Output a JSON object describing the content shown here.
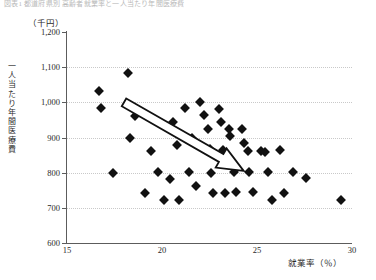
{
  "figure": {
    "caption": "図表1 都道府県別 高齢者就業率と一人当たり年間医療費",
    "y_unit": "（千円）",
    "y_axis_label": "一人当たり年間医療費",
    "x_axis_label": "就業率（％）"
  },
  "chart_data": {
    "type": "scatter",
    "title": "",
    "xlabel": "就業率（％）",
    "ylabel": "一人当たり年間医療費",
    "y_unit": "千円",
    "xlim": [
      15,
      30
    ],
    "ylim": [
      600,
      1200
    ],
    "xticks": [
      "15",
      "20",
      "25",
      "30"
    ],
    "yticks": [
      "600",
      "700",
      "800",
      "900",
      "1,000",
      "1,100",
      "1,200"
    ],
    "grid": "horizontal-dotted",
    "legend": "none",
    "marker": "diamond",
    "marker_color": "#111111",
    "annotation": {
      "kind": "block-arrow",
      "meaning": "negative-correlation-trend",
      "fill": "#ffffff",
      "stroke": "#111111",
      "from": [
        18.0,
        1000
      ],
      "to": [
        24.3,
        805
      ]
    },
    "points": [
      [
        16.7,
        1031
      ],
      [
        16.8,
        984
      ],
      [
        17.4,
        800
      ],
      [
        18.2,
        1084
      ],
      [
        18.3,
        899
      ],
      [
        18.6,
        961
      ],
      [
        19.1,
        741
      ],
      [
        19.4,
        863
      ],
      [
        19.8,
        803
      ],
      [
        20.1,
        722
      ],
      [
        20.4,
        781
      ],
      [
        20.6,
        945
      ],
      [
        20.8,
        879
      ],
      [
        20.9,
        723
      ],
      [
        21.2,
        984
      ],
      [
        21.4,
        802
      ],
      [
        21.6,
        899
      ],
      [
        21.8,
        762
      ],
      [
        22.0,
        1002
      ],
      [
        22.2,
        963
      ],
      [
        22.4,
        924
      ],
      [
        22.5,
        866
      ],
      [
        22.6,
        799
      ],
      [
        22.7,
        741
      ],
      [
        23.0,
        982
      ],
      [
        23.1,
        944
      ],
      [
        23.2,
        865
      ],
      [
        23.3,
        742
      ],
      [
        23.5,
        923
      ],
      [
        23.6,
        904
      ],
      [
        23.8,
        802
      ],
      [
        23.9,
        745
      ],
      [
        24.2,
        925
      ],
      [
        24.3,
        884
      ],
      [
        24.5,
        861
      ],
      [
        24.6,
        803
      ],
      [
        24.8,
        744
      ],
      [
        25.2,
        862
      ],
      [
        25.4,
        858
      ],
      [
        25.6,
        801
      ],
      [
        25.8,
        723
      ],
      [
        26.2,
        864
      ],
      [
        26.4,
        742
      ],
      [
        26.9,
        802
      ],
      [
        27.6,
        784
      ],
      [
        29.4,
        721
      ]
    ]
  }
}
